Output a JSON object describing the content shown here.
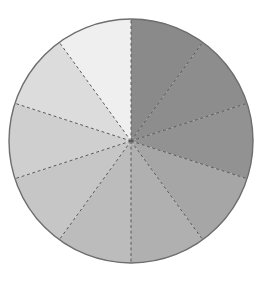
{
  "figure": {
    "name": "pie-chart-figure",
    "background_color": "#ffffff",
    "width": 273,
    "height": 282
  },
  "geometry": {
    "center_x": 131,
    "center_y": 141,
    "radius": 122,
    "start_angle_deg": -90,
    "direction": "clockwise"
  },
  "style": {
    "outline_color": "#6e6e6e",
    "outline_width": 1.4,
    "divider_color": "#5a5a5a",
    "divider_dash": "3 2.6",
    "divider_width": 1
  },
  "chart_data": {
    "type": "pie",
    "title": "",
    "subtitle": "",
    "xlabel": "",
    "ylabel": "",
    "legend": [],
    "legend_position": "none",
    "grid": false,
    "labels_shown": false,
    "slice_count": 10,
    "equal_slices": true,
    "slice_angle_deg": 36,
    "total": 100,
    "categories": [
      "Slice 1",
      "Slice 2",
      "Slice 3",
      "Slice 4",
      "Slice 5",
      "Slice 6",
      "Slice 7",
      "Slice 8",
      "Slice 9",
      "Slice 10"
    ],
    "values": [
      10,
      10,
      10,
      10,
      10,
      10,
      10,
      10,
      10,
      10
    ],
    "percentages": [
      "10%",
      "10%",
      "10%",
      "10%",
      "10%",
      "10%",
      "10%",
      "10%",
      "10%",
      "10%"
    ],
    "colors": [
      "#8a8a8a",
      "#8d8d8d",
      "#929292",
      "#a6a6a6",
      "#b0b0b0",
      "#bcbcbc",
      "#c6c6c6",
      "#cfcfcf",
      "#dcdcdc",
      "#efefef"
    ],
    "slices": [
      {
        "label": "Slice 1",
        "value": 10,
        "color": "#8a8a8a",
        "start_deg": -90,
        "end_deg": -54
      },
      {
        "label": "Slice 2",
        "value": 10,
        "color": "#8d8d8d",
        "start_deg": -54,
        "end_deg": -18
      },
      {
        "label": "Slice 3",
        "value": 10,
        "color": "#929292",
        "start_deg": -18,
        "end_deg": 18
      },
      {
        "label": "Slice 4",
        "value": 10,
        "color": "#a6a6a6",
        "start_deg": 18,
        "end_deg": 54
      },
      {
        "label": "Slice 5",
        "value": 10,
        "color": "#b0b0b0",
        "start_deg": 54,
        "end_deg": 90
      },
      {
        "label": "Slice 6",
        "value": 10,
        "color": "#bcbcbc",
        "start_deg": 90,
        "end_deg": 126
      },
      {
        "label": "Slice 7",
        "value": 10,
        "color": "#c6c6c6",
        "start_deg": 126,
        "end_deg": 162
      },
      {
        "label": "Slice 8",
        "value": 10,
        "color": "#cfcfcf",
        "start_deg": 162,
        "end_deg": 198
      },
      {
        "label": "Slice 9",
        "value": 10,
        "color": "#dcdcdc",
        "start_deg": 198,
        "end_deg": 234
      },
      {
        "label": "Slice 10",
        "value": 10,
        "color": "#efefef",
        "start_deg": 234,
        "end_deg": 270
      }
    ]
  }
}
